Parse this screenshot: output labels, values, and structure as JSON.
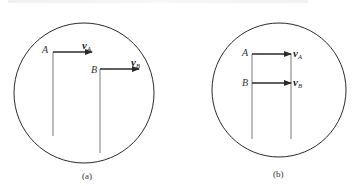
{
  "figure": {
    "panels": [
      {
        "id": "a",
        "caption": "(a)",
        "points": [
          {
            "label": "A",
            "velocity_symbol": "v",
            "velocity_subscript": "A"
          },
          {
            "label": "B",
            "velocity_symbol": "v",
            "velocity_subscript": "B"
          }
        ]
      },
      {
        "id": "b",
        "caption": "(b)",
        "points": [
          {
            "label": "A",
            "velocity_symbol": "v",
            "velocity_subscript": "A"
          },
          {
            "label": "B",
            "velocity_symbol": "v",
            "velocity_subscript": "B"
          }
        ]
      }
    ],
    "colors": {
      "stroke": "#2a2a2a",
      "background": "#ffffff"
    }
  }
}
